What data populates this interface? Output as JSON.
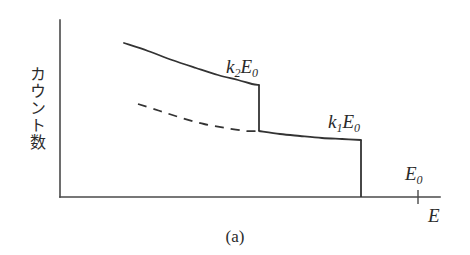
{
  "figure": {
    "caption": "(a)",
    "y_axis_label": "カウント数",
    "x_axis_label": "E",
    "edge_label_upper": "k",
    "edge_label_upper_sub": "2",
    "edge_label_upper_tail": "E",
    "edge_label_upper_tail_sub": "0",
    "edge_label_lower": "k",
    "edge_label_lower_sub": "1",
    "edge_label_lower_tail": "E",
    "edge_label_lower_tail_sub": "0",
    "tick_label": "E",
    "tick_label_sub": "0",
    "line_color": "#333333",
    "axis_color": "#4a4a4a",
    "background": "#ffffff"
  },
  "chart_data": {
    "type": "line",
    "title": "",
    "xlabel": "E",
    "ylabel": "カウント数",
    "xlim": [
      0,
      1
    ],
    "ylim": [
      0,
      1
    ],
    "grid": false,
    "legend": null,
    "annotations": [
      {
        "text": "k2E0",
        "x": 0.52,
        "y": 0.78,
        "note": "upper Compton edge label"
      },
      {
        "text": "k1E0",
        "x": 0.79,
        "y": 0.53,
        "note": "lower Compton edge label"
      },
      {
        "text": "E0",
        "x": 0.94,
        "y": 0.26,
        "note": "incident photon energy tick label"
      },
      {
        "text": "(a)",
        "x": 0.5,
        "y": -0.16,
        "note": "panel caption"
      }
    ],
    "axis_pixels": {
      "origin_x": 60,
      "origin_y": 197,
      "y_axis_top": 20,
      "x_axis_right": 440
    },
    "ticks": [
      {
        "label": "E0",
        "x_pixel": 418,
        "axis": "x"
      }
    ],
    "series": [
      {
        "name": "upper-continuum-solid",
        "style": "solid",
        "points_pixel": [
          [
            124,
            43
          ],
          [
            148,
            51
          ],
          [
            172,
            60
          ],
          [
            196,
            68
          ],
          [
            218,
            75
          ],
          [
            238,
            80
          ],
          [
            252,
            84
          ],
          [
            259,
            85
          ]
        ]
      },
      {
        "name": "upper-edge-drop",
        "style": "solid-vertical",
        "points_pixel": [
          [
            259,
            85
          ],
          [
            259,
            131
          ]
        ]
      },
      {
        "name": "lower-continuum-solid",
        "style": "solid",
        "points_pixel": [
          [
            259,
            131
          ],
          [
            280,
            134
          ],
          [
            300,
            136
          ],
          [
            322,
            138
          ],
          [
            342,
            139
          ],
          [
            361,
            140
          ]
        ]
      },
      {
        "name": "lower-edge-drop",
        "style": "solid-vertical",
        "points_pixel": [
          [
            361,
            140
          ],
          [
            361,
            197
          ]
        ]
      },
      {
        "name": "dashed-continuum",
        "style": "dashed",
        "points_pixel": [
          [
            138,
            104
          ],
          [
            160,
            111
          ],
          [
            182,
            118
          ],
          [
            204,
            124
          ],
          [
            226,
            128
          ],
          [
            246,
            131
          ],
          [
            259,
            131
          ]
        ]
      }
    ]
  }
}
